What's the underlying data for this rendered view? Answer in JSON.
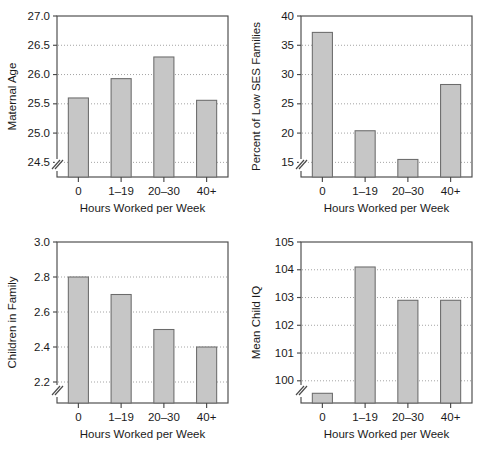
{
  "figure": {
    "panel_count": 4,
    "bar_fill_color": "#c6c6c6",
    "bar_border_color": "#6b6b6b",
    "axis_color": "#4a4a4a",
    "gridline_color": "#9a9a9a",
    "background_color": "#ffffff"
  },
  "chart_data": [
    {
      "type": "bar",
      "title": "",
      "xlabel": "Hours Worked per Week",
      "ylabel": "Maternal Age",
      "categories": [
        "0",
        "1–19",
        "20–30",
        "40+"
      ],
      "values": [
        25.6,
        25.93,
        26.3,
        25.56
      ],
      "ylim": [
        24.25,
        27.0
      ],
      "yticks": [
        24.5,
        25.0,
        25.5,
        26.0,
        26.5,
        27.0
      ],
      "ytick_labels": [
        "24.5",
        "25.0",
        "25.5",
        "26.0",
        "26.5",
        "27.0"
      ],
      "axis_break": true,
      "grid": true,
      "legend": "none"
    },
    {
      "type": "bar",
      "title": "",
      "xlabel": "Hours Worked per Week",
      "ylabel": "Percent of Low SES Families",
      "categories": [
        "0",
        "1–19",
        "20–30",
        "40+"
      ],
      "values": [
        37.2,
        20.4,
        15.5,
        28.3
      ],
      "ylim": [
        12.5,
        40
      ],
      "yticks": [
        15,
        20,
        25,
        30,
        35,
        40
      ],
      "ytick_labels": [
        "15",
        "20",
        "25",
        "30",
        "35",
        "40"
      ],
      "axis_break": true,
      "grid": true,
      "legend": "none"
    },
    {
      "type": "bar",
      "title": "",
      "xlabel": "Hours Worked per Week",
      "ylabel": "Children in Family",
      "categories": [
        "0",
        "1–19",
        "20–30",
        "40+"
      ],
      "values": [
        2.8,
        2.7,
        2.5,
        2.4
      ],
      "ylim": [
        2.08,
        3.0
      ],
      "yticks": [
        2.2,
        2.4,
        2.6,
        2.8,
        3.0
      ],
      "ytick_labels": [
        "2.2",
        "2.4",
        "2.6",
        "2.8",
        "3.0"
      ],
      "axis_break": true,
      "grid": true,
      "legend": "none"
    },
    {
      "type": "bar",
      "title": "",
      "xlabel": "Hours Worked per Week",
      "ylabel": "Mean Child IQ",
      "categories": [
        "0",
        "1–19",
        "20–30",
        "40+"
      ],
      "values": [
        99.55,
        104.1,
        102.9,
        102.9
      ],
      "ylim": [
        99.2,
        105
      ],
      "yticks": [
        100,
        101,
        102,
        103,
        104,
        105
      ],
      "ytick_labels": [
        "100",
        "101",
        "102",
        "103",
        "104",
        "105"
      ],
      "axis_break": true,
      "grid": true,
      "legend": "none"
    }
  ]
}
